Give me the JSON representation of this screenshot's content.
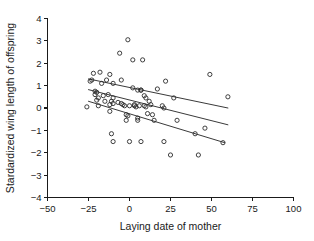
{
  "chart_data": {
    "type": "scatter",
    "title": "",
    "xlabel": "Laying date of mother",
    "ylabel": "Stardardized wing length of offspring",
    "xlim": [
      -50,
      100
    ],
    "ylim": [
      -4,
      4
    ],
    "xticks": [
      -50,
      -25,
      0,
      25,
      50,
      75,
      100
    ],
    "yticks": [
      4,
      3,
      2,
      1,
      0,
      -1,
      -2,
      -3,
      -4
    ],
    "xticklabels": [
      "−50",
      "−25",
      "0",
      "25",
      "50",
      "75",
      "100"
    ],
    "yticklabels": [
      "4",
      "3",
      "2",
      "1",
      "0",
      "−1",
      "−2",
      "−3",
      "−4"
    ],
    "grid": false,
    "legend": null,
    "marker": "open-circle",
    "marker_color": "#2b2b2b",
    "points": [
      [
        -26,
        0.05
      ],
      [
        -24,
        1.2
      ],
      [
        -23,
        1.25
      ],
      [
        -22,
        1.55
      ],
      [
        -21,
        0.75
      ],
      [
        -21,
        0.6
      ],
      [
        -20,
        0.7
      ],
      [
        -20,
        0.35
      ],
      [
        -19,
        0.45
      ],
      [
        -19,
        0.1
      ],
      [
        -18,
        1.6
      ],
      [
        -17,
        1.1
      ],
      [
        -16,
        0.55
      ],
      [
        -15,
        0.3
      ],
      [
        -14,
        1.25
      ],
      [
        -13,
        0.6
      ],
      [
        -12,
        1.5
      ],
      [
        -12,
        0.15
      ],
      [
        -12,
        -0.15
      ],
      [
        -11,
        0.3
      ],
      [
        -11,
        -1.15
      ],
      [
        -10,
        1.1
      ],
      [
        -10,
        0.45
      ],
      [
        -10,
        0.2
      ],
      [
        -10,
        -1.5
      ],
      [
        -7,
        0.25
      ],
      [
        -6,
        2.45
      ],
      [
        -5,
        1.25
      ],
      [
        -5,
        0.2
      ],
      [
        -4,
        0.15
      ],
      [
        -3,
        0.1
      ],
      [
        -2,
        -0.3
      ],
      [
        -2,
        -0.55
      ],
      [
        -1,
        3.05
      ],
      [
        -1,
        -0.35
      ],
      [
        0,
        0.1
      ],
      [
        0,
        -1.5
      ],
      [
        2,
        0.9
      ],
      [
        2,
        2.15
      ],
      [
        3,
        0.15
      ],
      [
        3,
        0.1
      ],
      [
        4,
        0.05
      ],
      [
        5,
        0.8
      ],
      [
        5,
        -0.45
      ],
      [
        5,
        -0.55
      ],
      [
        6,
        0.1
      ],
      [
        7,
        0.8
      ],
      [
        7,
        0.8
      ],
      [
        7,
        -1.5
      ],
      [
        8,
        2.15
      ],
      [
        9,
        0.55
      ],
      [
        9,
        0.1
      ],
      [
        10,
        0.45
      ],
      [
        10,
        0.05
      ],
      [
        11,
        -0.25
      ],
      [
        12,
        0.3
      ],
      [
        13,
        0.15
      ],
      [
        14,
        -0.3
      ],
      [
        15,
        -0.55
      ],
      [
        17,
        0.85
      ],
      [
        20,
        0.1
      ],
      [
        21,
        0.0
      ],
      [
        21,
        -1.5
      ],
      [
        22,
        1.2
      ],
      [
        25,
        -2.1
      ],
      [
        27,
        0.45
      ],
      [
        29,
        -0.55
      ],
      [
        40,
        -1.15
      ],
      [
        42,
        -2.1
      ],
      [
        46,
        -0.9
      ],
      [
        49,
        1.5
      ],
      [
        57,
        -1.55
      ],
      [
        60,
        0.5
      ]
    ],
    "fit_lines": [
      {
        "name": "upper-fit",
        "x": [
          -25,
          60
        ],
        "y": [
          1.3,
          0.0
        ],
        "style": "solid"
      },
      {
        "name": "middle-fit",
        "x": [
          -25,
          60
        ],
        "y": [
          0.82,
          -0.75
        ],
        "style": "solid"
      },
      {
        "name": "lower-fit",
        "x": [
          -25,
          58
        ],
        "y": [
          0.3,
          -1.55
        ],
        "style": "solid"
      }
    ]
  }
}
